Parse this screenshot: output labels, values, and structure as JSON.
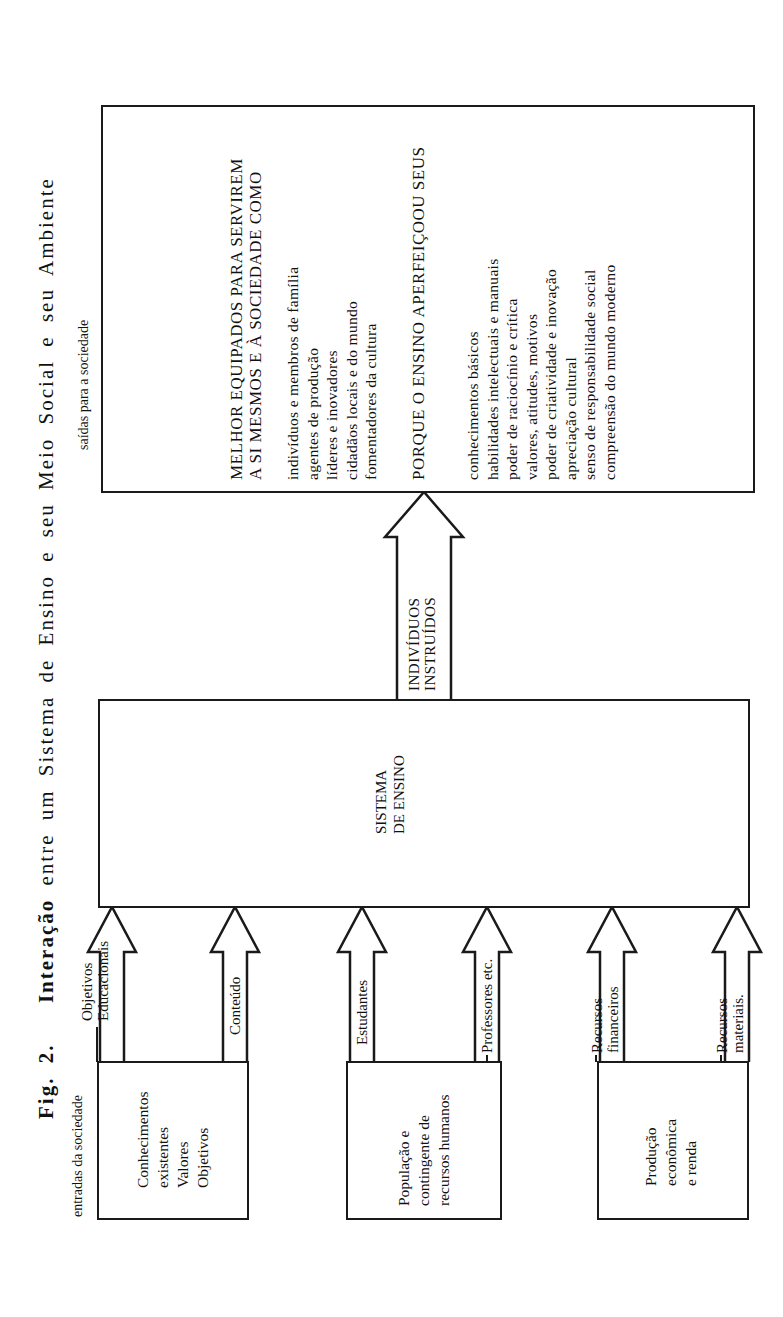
{
  "figure": {
    "title_prefix": "Fig. 2.",
    "title_bold_word": "Interação",
    "title_rest": "entre um Sistema de Ensino e seu Meio Social e seu Ambiente",
    "inputs_caption": "entradas da sociedade",
    "outputs_caption": "saídas para a sociedade"
  },
  "input_sources": [
    {
      "lines": [
        "Conhecimentos",
        "existentes",
        "Valores",
        "Objetivos"
      ]
    },
    {
      "lines": [
        "População e",
        "contingente de",
        "recursos humanos"
      ]
    },
    {
      "lines": [
        "Produção",
        "econômica",
        "e renda"
      ]
    }
  ],
  "input_arrows": [
    {
      "lines": [
        "Objetivos",
        "Educacionais"
      ]
    },
    {
      "lines": [
        "Conteúdo"
      ]
    },
    {
      "lines": [
        "Estudantes"
      ]
    },
    {
      "lines": [
        "Professores etc."
      ]
    },
    {
      "lines": [
        "Recursos",
        "financeiros"
      ]
    },
    {
      "lines": [
        "Recursos",
        "materiais."
      ]
    }
  ],
  "system_box": {
    "lines": [
      "SISTEMA",
      "DE ENSINO"
    ]
  },
  "output_arrow": {
    "lines": [
      "INDIVÍDUOS",
      "INSTRUÍDOS"
    ]
  },
  "output_box": {
    "heading1": [
      "MELHOR EQUIPADOS PARA SERVIREM",
      "A SI MESMOS E À SOCIEDADE COMO"
    ],
    "roles": [
      "indivíduos e membros de família",
      "agentes de produção",
      "líderes e inovadores",
      "cidadãos locais e do mundo",
      "fomentadores da cultura"
    ],
    "heading2": "PORQUE O ENSINO APERFEIÇOOU SEUS",
    "qualities": [
      "conhecimentos básicos",
      "habilidades intelectuais e manuais",
      "poder de raciocínio e crítica",
      "valores, atitudes, motivos",
      "poder de criatividade e inovação",
      "apreciação cultural",
      "senso de responsabilidade social",
      "compreensão do mundo moderno"
    ]
  }
}
